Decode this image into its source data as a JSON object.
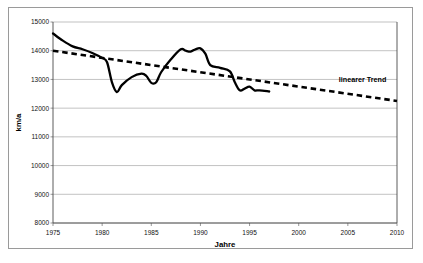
{
  "chart_data": {
    "type": "line",
    "title": "",
    "xlabel": "Jahre",
    "ylabel": "km/a",
    "xlim": [
      1975,
      2010
    ],
    "ylim": [
      8000,
      15000
    ],
    "grid": true,
    "legend_position": "inline-right",
    "x_ticks": [
      "1975",
      "1980",
      "1985",
      "1990",
      "1995",
      "2000",
      "2005",
      "2010"
    ],
    "x_tick_values": [
      1975,
      1980,
      1985,
      1990,
      1995,
      2000,
      2005,
      2010
    ],
    "y_ticks": [
      "8000",
      "9000",
      "10000",
      "11000",
      "12000",
      "13000",
      "14000",
      "15000"
    ],
    "y_tick_values": [
      8000,
      9000,
      10000,
      11000,
      12000,
      13000,
      14000,
      15000
    ],
    "series": [
      {
        "name": "Fahrleistung",
        "style": "solid",
        "color": "#000000",
        "x": [
          1975,
          1976,
          1977,
          1978,
          1979,
          1980,
          1980.5,
          1981,
          1981.5,
          1982,
          1983,
          1984,
          1984.5,
          1985,
          1985.5,
          1986,
          1987,
          1988,
          1988.5,
          1989,
          1989.5,
          1990,
          1990.5,
          1991,
          1992,
          1993,
          1993.5,
          1994,
          1994.5,
          1995,
          1995.5,
          1996,
          1997
        ],
        "values": [
          14600,
          14350,
          14150,
          14050,
          13920,
          13750,
          13600,
          12900,
          12560,
          12800,
          13080,
          13200,
          13120,
          12880,
          12900,
          13250,
          13700,
          14050,
          14000,
          13970,
          14050,
          14080,
          13900,
          13500,
          13400,
          13280,
          12900,
          12620,
          12680,
          12750,
          12620,
          12620,
          12580
        ]
      },
      {
        "name": "linearer Trend",
        "style": "dashed",
        "color": "#000000",
        "x": [
          1975,
          2010
        ],
        "values": [
          14000,
          12250
        ]
      }
    ],
    "annotations": [
      {
        "text": "linearer Trend",
        "x": 2006.5,
        "y": 12900
      }
    ]
  }
}
